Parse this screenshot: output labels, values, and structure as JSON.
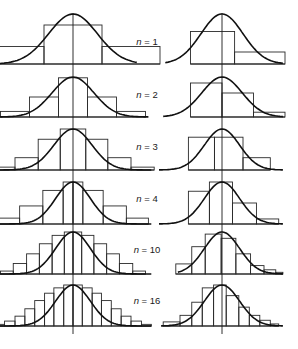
{
  "figure": {
    "n_label_prefix": "n = ",
    "colors": {
      "ink": "#111111",
      "background": "#ffffff"
    }
  },
  "rows": [
    {
      "n": "1",
      "left": {
        "bins": [
          [
            -1.5,
            -0.5,
            0.35
          ],
          [
            -0.5,
            0.5,
            0.78
          ],
          [
            0.5,
            1.5,
            0.35
          ]
        ]
      },
      "right": {
        "bins": [
          [
            -0.75,
            0.3,
            0.65
          ],
          [
            0.3,
            1.5,
            0.24
          ]
        ]
      }
    },
    {
      "n": "2",
      "left": {
        "bins": [
          [
            -1.25,
            -0.75,
            0.14
          ],
          [
            -0.75,
            -0.25,
            0.5
          ],
          [
            -0.25,
            0.25,
            0.98
          ],
          [
            0.25,
            0.75,
            0.5
          ],
          [
            0.75,
            1.25,
            0.14
          ]
        ]
      },
      "right": {
        "bins": [
          [
            -0.75,
            0.0,
            0.85
          ],
          [
            0.0,
            0.75,
            0.6
          ],
          [
            0.75,
            1.5,
            0.12
          ]
        ]
      }
    },
    {
      "n": "3",
      "left": {
        "bins": [
          [
            -1.4,
            -1.0,
            0.07
          ],
          [
            -1.0,
            -0.6,
            0.3
          ],
          [
            -0.6,
            -0.22,
            0.75
          ],
          [
            -0.22,
            0.22,
            1.0
          ],
          [
            0.22,
            0.6,
            0.75
          ],
          [
            0.6,
            1.0,
            0.3
          ],
          [
            1.0,
            1.4,
            0.07
          ]
        ]
      },
      "right": {
        "bins": [
          [
            -0.8,
            -0.18,
            0.8
          ],
          [
            -0.18,
            0.5,
            0.8
          ],
          [
            0.5,
            1.15,
            0.3
          ]
        ]
      }
    },
    {
      "n": "4",
      "left": {
        "bins": [
          [
            -1.3,
            -0.92,
            0.14
          ],
          [
            -0.92,
            -0.52,
            0.43
          ],
          [
            -0.52,
            -0.17,
            0.8
          ],
          [
            -0.17,
            0.0,
            1.0
          ],
          [
            0.0,
            0.17,
            1.0
          ],
          [
            0.17,
            0.52,
            0.8
          ],
          [
            0.52,
            0.92,
            0.43
          ],
          [
            0.92,
            1.3,
            0.14
          ]
        ]
      },
      "right": {
        "bins": [
          [
            -0.8,
            -0.3,
            0.78
          ],
          [
            -0.3,
            0.25,
            1.0
          ],
          [
            0.25,
            0.82,
            0.5
          ],
          [
            0.82,
            1.35,
            0.12
          ]
        ]
      }
    },
    {
      "n": "10",
      "left": {
        "bins": [
          [
            -1.25,
            -1.03,
            0.07
          ],
          [
            -1.03,
            -0.8,
            0.25
          ],
          [
            -0.8,
            -0.58,
            0.48
          ],
          [
            -0.58,
            -0.36,
            0.72
          ],
          [
            -0.36,
            -0.15,
            0.92
          ],
          [
            -0.15,
            0.0,
            1.0
          ],
          [
            0.0,
            0.15,
            1.0
          ],
          [
            0.15,
            0.36,
            0.92
          ],
          [
            0.36,
            0.58,
            0.72
          ],
          [
            0.58,
            0.8,
            0.48
          ],
          [
            0.8,
            1.03,
            0.25
          ],
          [
            1.03,
            1.25,
            0.07
          ]
        ]
      },
      "right": {
        "bins": [
          [
            -1.1,
            -0.72,
            0.24
          ],
          [
            -0.72,
            -0.4,
            0.65
          ],
          [
            -0.4,
            -0.02,
            0.95
          ],
          [
            -0.02,
            0.33,
            0.85
          ],
          [
            0.33,
            0.68,
            0.48
          ],
          [
            0.68,
            1.0,
            0.2
          ],
          [
            1.0,
            1.28,
            0.1
          ],
          [
            1.28,
            1.45,
            0.04
          ]
        ]
      }
    },
    {
      "n": "16",
      "left": {
        "bins": [
          [
            -1.35,
            -1.18,
            0.04
          ],
          [
            -1.18,
            -1.0,
            0.12
          ],
          [
            -1.0,
            -0.83,
            0.24
          ],
          [
            -0.83,
            -0.66,
            0.42
          ],
          [
            -0.66,
            -0.49,
            0.62
          ],
          [
            -0.49,
            -0.33,
            0.8
          ],
          [
            -0.33,
            -0.16,
            0.93
          ],
          [
            -0.16,
            0.0,
            1.0
          ],
          [
            0.0,
            0.16,
            1.0
          ],
          [
            0.16,
            0.33,
            0.93
          ],
          [
            0.33,
            0.49,
            0.8
          ],
          [
            0.49,
            0.66,
            0.62
          ],
          [
            0.66,
            0.83,
            0.42
          ],
          [
            0.83,
            1.0,
            0.24
          ],
          [
            1.0,
            1.18,
            0.12
          ],
          [
            1.18,
            1.35,
            0.04
          ]
        ]
      },
      "right": {
        "bins": [
          [
            -1.4,
            -1.0,
            0.1
          ],
          [
            -1.0,
            -0.72,
            0.26
          ],
          [
            -0.72,
            -0.47,
            0.58
          ],
          [
            -0.47,
            -0.2,
            0.93
          ],
          [
            -0.2,
            0.1,
            1.0
          ],
          [
            0.1,
            0.4,
            0.74
          ],
          [
            0.4,
            0.65,
            0.46
          ],
          [
            0.65,
            0.9,
            0.26
          ],
          [
            0.9,
            1.15,
            0.14
          ],
          [
            1.15,
            1.35,
            0.05
          ]
        ]
      }
    }
  ]
}
